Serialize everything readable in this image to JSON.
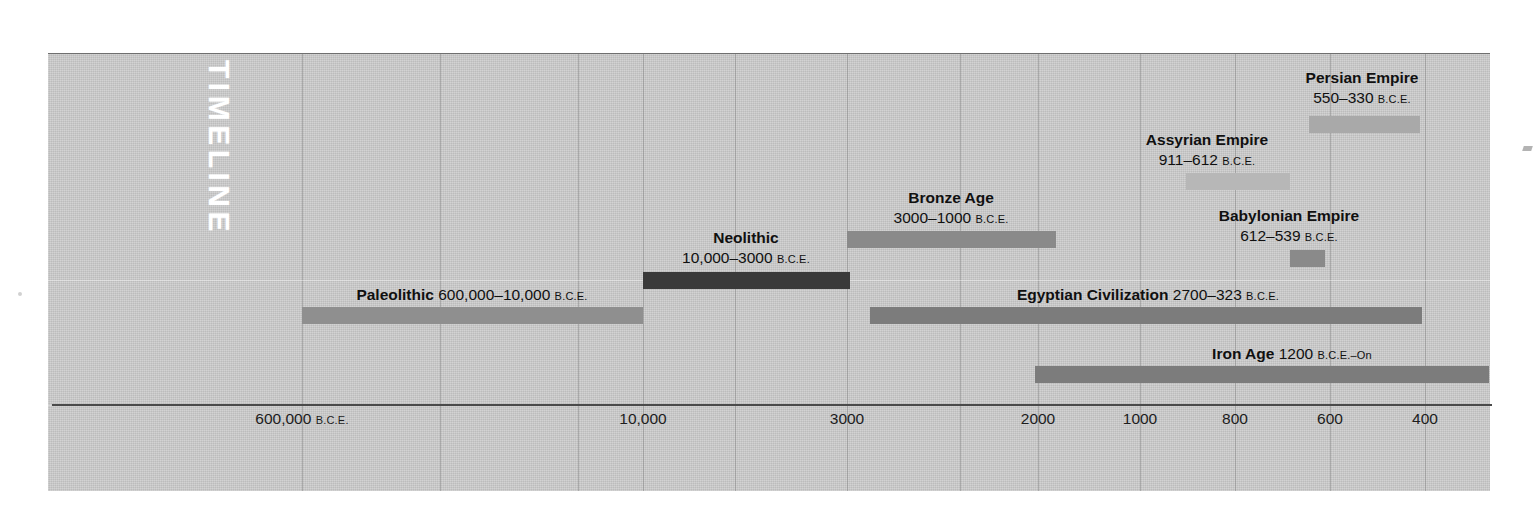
{
  "figure": {
    "vertical_title": "TIMELINE",
    "era_suffix": "B.C.E.",
    "panel_color": "#c9c9c9",
    "axis_color": "#4a4a4a"
  },
  "chart_data": {
    "type": "bar",
    "title": "TIMELINE",
    "orientation": "horizontal",
    "xlabel": "",
    "ylabel": "",
    "grid": true,
    "legend": "none",
    "axis_note": "Non-linear (compressed) time axis, years B.C.E. decreasing left to right",
    "tick_labels": [
      "600,000 B.C.E.",
      "10,000",
      "3000",
      "2000",
      "1000",
      "800",
      "600",
      "400"
    ],
    "tick_values": [
      600000,
      10000,
      3000,
      2000,
      1000,
      800,
      600,
      400
    ],
    "tick_x_px": [
      302,
      643,
      847,
      1038,
      1140,
      1235,
      1330,
      1425
    ],
    "categories": [
      "Paleolithic",
      "Neolithic",
      "Bronze Age",
      "Egyptian Civilization",
      "Iron Age",
      "Assyrian Empire",
      "Babylonian Empire",
      "Persian Empire"
    ],
    "series": [
      {
        "name": "Start year (B.C.E.)",
        "values": [
          600000,
          10000,
          3000,
          2700,
          1200,
          911,
          612,
          550
        ]
      },
      {
        "name": "End year (B.C.E.)",
        "values": [
          10000,
          3000,
          1000,
          323,
          0,
          612,
          539,
          330
        ]
      }
    ]
  },
  "events": [
    {
      "id": "paleolithic",
      "title": "Paleolithic",
      "range": "600,000–10,000",
      "era": "B.C.E.",
      "label_layout": "inline",
      "label_align": "center",
      "bar": {
        "left": 302,
        "width": 341,
        "top": 307,
        "color": "#8f8f8f"
      },
      "label": {
        "left": 472,
        "top": 285
      }
    },
    {
      "id": "neolithic",
      "title": "Neolithic",
      "range": "10,000–3000",
      "era": "B.C.E.",
      "label_layout": "stacked",
      "label_align": "center",
      "bar": {
        "left": 643,
        "width": 207,
        "top": 272,
        "color": "#3a3a3a"
      },
      "label": {
        "left": 746,
        "top": 228
      }
    },
    {
      "id": "bronze-age",
      "title": "Bronze Age",
      "range": "3000–1000",
      "era": "B.C.E.",
      "label_layout": "stacked",
      "label_align": "center",
      "bar": {
        "left": 847,
        "width": 209,
        "top": 231,
        "color": "#8a8a8a"
      },
      "label": {
        "left": 951,
        "top": 188
      }
    },
    {
      "id": "egyptian-civilization",
      "title": "Egyptian Civilization",
      "range": "2700–323",
      "era": "B.C.E.",
      "label_layout": "inline",
      "label_align": "center",
      "bar": {
        "left": 870,
        "width": 552,
        "top": 307,
        "color": "#7c7c7c"
      },
      "label": {
        "left": 1148,
        "top": 285
      }
    },
    {
      "id": "iron-age",
      "title": "Iron Age",
      "range": "1200",
      "era": "B.C.E.–On",
      "label_layout": "inline",
      "label_align": "center",
      "bar": {
        "left": 1035,
        "width": 454,
        "top": 366,
        "color": "#7c7c7c"
      },
      "label": {
        "left": 1292,
        "top": 344
      }
    },
    {
      "id": "assyrian-empire",
      "title": "Assyrian Empire",
      "range": "911–612",
      "era": "B.C.E.",
      "label_layout": "stacked",
      "label_align": "center",
      "bar": {
        "left": 1186,
        "width": 104,
        "top": 173,
        "color": "#b7b7b7"
      },
      "label": {
        "left": 1207,
        "top": 130
      }
    },
    {
      "id": "babylonian-empire",
      "title": "Babylonian Empire",
      "range": "612–539",
      "era": "B.C.E.",
      "label_layout": "stacked",
      "label_align": "center",
      "bar": {
        "left": 1290,
        "width": 35,
        "top": 250,
        "color": "#8a8a8a"
      },
      "label": {
        "left": 1289,
        "top": 206
      }
    },
    {
      "id": "persian-empire",
      "title": "Persian Empire",
      "range": "550–330",
      "era": "B.C.E.",
      "label_layout": "stacked",
      "label_align": "center",
      "bar": {
        "left": 1309,
        "width": 111,
        "top": 116,
        "color": "#a9a9a9"
      },
      "label": {
        "left": 1362,
        "top": 68
      }
    }
  ],
  "gridlines_px": [
    302,
    440,
    578,
    643,
    735,
    847,
    960,
    1038,
    1140,
    1235,
    1330,
    1425
  ]
}
